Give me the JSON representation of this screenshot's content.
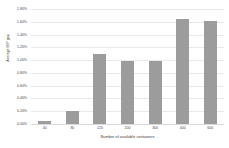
{
  "chart_data": {
    "type": "bar",
    "title": "",
    "xlabel": "Number of available containers",
    "ylabel": "Average MIP gap",
    "categories": [
      "40",
      "80",
      "120",
      "200",
      "300",
      "400",
      "600"
    ],
    "values": [
      0.05,
      0.2,
      1.1,
      0.98,
      0.98,
      1.65,
      1.62
    ],
    "value_labels": [
      "0.05%",
      "0.20%",
      "1.10%",
      "0.98%",
      "0.98%",
      "1.65%",
      "1.62%"
    ],
    "ylim": [
      0.0,
      1.8
    ],
    "ytick_values": [
      1.8,
      1.6,
      1.4,
      1.2,
      1.0,
      0.8,
      0.6,
      0.4,
      0.2,
      0.0
    ],
    "ytick_labels": [
      "1.80%",
      "1.60%",
      "1.40%",
      "1.20%",
      "1.00%",
      "0.80%",
      "0.60%",
      "0.40%",
      "0.20%",
      "0.00%"
    ],
    "grid": true,
    "legend": null,
    "bar_color": "#9c9c9c",
    "grid_color": "#e9e9e9",
    "background_color": "#ffffff"
  }
}
